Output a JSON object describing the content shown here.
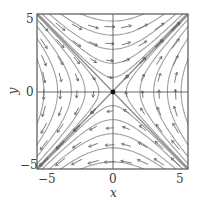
{
  "figure": {
    "type": "phase_portrait",
    "system": {
      "dx_dt": "y",
      "dy_dt": "x"
    },
    "equilibrium": {
      "x": 0,
      "y": 0,
      "type": "saddle"
    },
    "separatrices": [
      {
        "line": "y = -x",
        "direction": "toward origin",
        "emphasized": true
      },
      {
        "line": "y = x",
        "direction": "away from origin",
        "emphasized": true
      }
    ],
    "xlabel": "x",
    "ylabel": "y",
    "xticks": [
      "-5",
      "0",
      "5"
    ],
    "yticks": [
      "5",
      "0",
      "-5"
    ],
    "xlim": [
      -5.5,
      5.5
    ],
    "ylim": [
      -5.5,
      5.5
    ],
    "colors": {
      "frame": "#555555",
      "axis": "#444444",
      "streamline": "#a0a0a0",
      "separatrix": "#8a8a8a",
      "arrow": "#6a6a6a",
      "equilibrium": "#111111",
      "text": "#3a3a3a"
    }
  },
  "labels": {
    "x_tick_neg5": "−5",
    "x_tick_0": "0",
    "x_tick_5": "5",
    "y_tick_5": "5",
    "y_tick_0": "0",
    "y_tick_neg5": "−5",
    "x_axis": "x",
    "y_axis": "y"
  }
}
